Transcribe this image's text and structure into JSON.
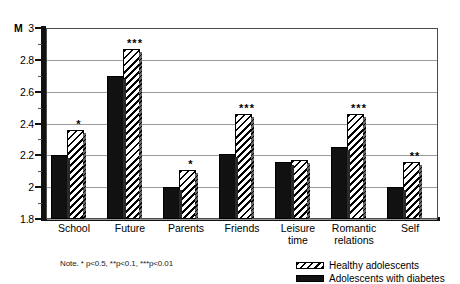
{
  "chart_data": {
    "type": "bar",
    "title": "",
    "xlabel": "",
    "ylabel": "M",
    "ylim": [
      1.8,
      3
    ],
    "ytick_labels": [
      "3",
      "2.8",
      "2.6",
      "2.4",
      "2.2",
      "2",
      "1.8"
    ],
    "ytick_values": [
      3,
      2.8,
      2.6,
      2.4,
      2.2,
      2,
      1.8
    ],
    "grid": true,
    "legend_position": "bottom-right",
    "categories": [
      "School",
      "Future",
      "Parents",
      "Friends",
      "Leisure time",
      "Romantic relations",
      "Self"
    ],
    "series": [
      {
        "name": "Adolescents with diabetes",
        "pattern": "solid-black",
        "values": [
          2.2,
          2.7,
          2.0,
          2.21,
          2.16,
          2.25,
          2.0
        ]
      },
      {
        "name": "Healthy adolescents",
        "pattern": "diagonal-hatch",
        "values": [
          2.36,
          2.87,
          2.11,
          2.46,
          2.17,
          2.46,
          2.16
        ]
      }
    ],
    "significance_annotations": [
      "*",
      "***",
      "*",
      "***",
      "",
      "***",
      "**"
    ],
    "note": "Note. * p<0.5, **p<0.1, ***p<0.01"
  },
  "legend": {
    "items": [
      {
        "label": "Healthy adolescents",
        "pattern": "diagonal-hatch"
      },
      {
        "label": "Adolescents with diabetes",
        "pattern": "solid-black"
      }
    ]
  }
}
